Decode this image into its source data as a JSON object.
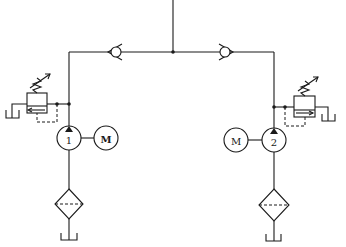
{
  "diagram": {
    "type": "hydraulic-circuit",
    "pumps": [
      {
        "id": "pump-1",
        "label": "1",
        "motor_label": "M"
      },
      {
        "id": "pump-2",
        "label": "2",
        "motor_label": "M"
      }
    ],
    "components": [
      "check-valve-left",
      "check-valve-right",
      "relief-valve-left",
      "relief-valve-right",
      "filter-left",
      "filter-right",
      "tank-left-pump",
      "tank-right-pump",
      "tank-left-relief",
      "tank-right-relief"
    ],
    "colors": {
      "line": "#1a1a1a",
      "background": "#ffffff"
    }
  }
}
